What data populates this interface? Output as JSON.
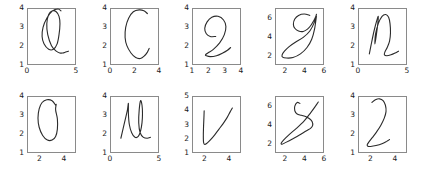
{
  "figure": {
    "title": "",
    "layout": {
      "rows": 2,
      "cols": 5
    },
    "stroke_color": "#2b2b2b",
    "axes_color": "#8a8a8a",
    "background": "#ffffff"
  },
  "chart_data": {
    "type": "line",
    "title": "",
    "xlabel": "",
    "ylabel": "",
    "panels": [
      {
        "letter": "a",
        "row": 0,
        "col": 0,
        "xlim": [
          0,
          5
        ],
        "ylim": [
          1,
          4
        ],
        "xticks": [
          0,
          5
        ],
        "yticks": [
          1,
          2,
          3,
          4
        ],
        "xticklabels": [
          "0",
          "5"
        ],
        "yticklabels": [
          "1",
          "2",
          "3",
          "4"
        ],
        "series": [
          {
            "name": "pen-stroke",
            "x": [
              3.5,
              3.2,
              2.6,
              2.0,
              1.6,
              1.5,
              1.7,
              2.2,
              2.7,
              3.1,
              3.3,
              3.4,
              3.3,
              3.0,
              2.6,
              2.2,
              2.0,
              2.1,
              2.5,
              3.0,
              3.4,
              3.7,
              4.0,
              4.3
            ],
            "y": [
              3.9,
              4.0,
              3.9,
              3.5,
              3.0,
              2.5,
              2.1,
              1.8,
              1.8,
              2.1,
              2.6,
              3.2,
              3.6,
              3.85,
              3.9,
              3.7,
              3.2,
              2.6,
              2.0,
              1.7,
              1.6,
              1.6,
              1.65,
              1.7
            ]
          }
        ]
      },
      {
        "letter": "c",
        "row": 0,
        "col": 1,
        "xlim": [
          0,
          4
        ],
        "ylim": [
          1,
          4
        ],
        "xticks": [
          0,
          2,
          4
        ],
        "yticks": [
          1,
          2,
          3,
          4
        ],
        "xticklabels": [
          "0",
          "2",
          "4"
        ],
        "yticklabels": [
          "1",
          "2",
          "3",
          "4"
        ],
        "series": [
          {
            "name": "pen-stroke",
            "x": [
              3.1,
              2.8,
              2.4,
              1.9,
              1.5,
              1.25,
              1.2,
              1.35,
              1.7,
              2.1,
              2.5,
              2.85,
              3.1,
              3.25
            ],
            "y": [
              3.75,
              3.9,
              3.95,
              3.85,
              3.5,
              3.0,
              2.45,
              2.0,
              1.6,
              1.35,
              1.3,
              1.45,
              1.65,
              1.85
            ]
          }
        ]
      },
      {
        "letter": "e",
        "row": 0,
        "col": 2,
        "xlim": [
          1,
          4
        ],
        "ylim": [
          1,
          4
        ],
        "xticks": [
          1,
          2,
          3,
          4
        ],
        "yticks": [
          1,
          2,
          3,
          4
        ],
        "xticklabels": [
          "1",
          "2",
          "3",
          "4"
        ],
        "yticklabels": [
          "1",
          "2",
          "3",
          "4"
        ],
        "series": [
          {
            "name": "pen-stroke",
            "x": [
              2.45,
              2.1,
              1.85,
              1.75,
              1.9,
              2.2,
              2.6,
              2.95,
              3.1,
              3.0,
              2.7,
              2.3,
              1.95,
              1.8,
              1.85,
              2.1,
              2.5,
              2.9,
              3.2,
              3.4
            ],
            "y": [
              2.5,
              2.5,
              2.65,
              2.95,
              3.3,
              3.55,
              3.6,
              3.4,
              3.05,
              2.6,
              2.15,
              1.8,
              1.6,
              1.5,
              1.45,
              1.4,
              1.45,
              1.6,
              1.75,
              1.9
            ]
          }
        ]
      },
      {
        "letter": "g",
        "row": 0,
        "col": 3,
        "xlim": [
          1,
          6
        ],
        "ylim": [
          1,
          7
        ],
        "xticks": [
          2,
          4,
          6
        ],
        "yticks": [
          2,
          4,
          6
        ],
        "xticklabels": [
          "2",
          "4",
          "6"
        ],
        "yticklabels": [
          "2",
          "4",
          "6"
        ],
        "series": [
          {
            "name": "pen-stroke",
            "x": [
              4.6,
              4.0,
              3.4,
              3.0,
              2.85,
              3.0,
              3.4,
              3.9,
              4.35,
              4.7,
              5.0,
              5.2,
              5.3,
              5.1,
              4.6,
              3.9,
              3.1,
              2.4,
              1.9,
              1.65,
              1.7,
              2.1,
              2.8,
              3.6,
              4.3,
              4.8,
              5.1,
              5.3
            ],
            "y": [
              6.3,
              6.45,
              6.3,
              5.9,
              5.35,
              4.9,
              4.6,
              4.55,
              4.8,
              5.2,
              5.7,
              6.1,
              6.4,
              5.6,
              4.6,
              3.9,
              3.4,
              2.9,
              2.4,
              2.0,
              1.75,
              1.65,
              1.7,
              2.1,
              2.8,
              3.7,
              4.8,
              6.2
            ]
          }
        ]
      },
      {
        "letter": "n",
        "row": 0,
        "col": 4,
        "xlim": [
          0,
          5
        ],
        "ylim": [
          1,
          4
        ],
        "xticks": [
          0,
          5
        ],
        "yticks": [
          1,
          2,
          3,
          4
        ],
        "xticklabels": [
          "0",
          "5"
        ],
        "yticklabels": [
          "1",
          "2",
          "3",
          "4"
        ],
        "series": [
          {
            "name": "pen-stroke",
            "x": [
              1.1,
              1.35,
              1.6,
              1.85,
              2.05,
              2.0,
              1.85,
              1.7,
              1.75,
              2.05,
              2.45,
              2.85,
              3.15,
              3.3,
              3.35,
              3.25,
              3.0,
              2.75,
              2.7,
              2.95,
              3.4,
              3.85,
              4.2
            ],
            "y": [
              1.55,
              2.2,
              2.8,
              3.3,
              3.6,
              3.2,
              2.6,
              2.1,
              2.6,
              3.2,
              3.6,
              3.7,
              3.55,
              3.2,
              2.7,
              2.25,
              1.9,
              1.65,
              1.5,
              1.45,
              1.5,
              1.6,
              1.7
            ]
          }
        ]
      },
      {
        "letter": "o",
        "row": 1,
        "col": 0,
        "xlim": [
          1,
          5
        ],
        "ylim": [
          1,
          4
        ],
        "xticks": [
          2,
          4
        ],
        "yticks": [
          1,
          2,
          3,
          4
        ],
        "xticklabels": [
          "2",
          "4"
        ],
        "yticklabels": [
          "1",
          "2",
          "3",
          "4"
        ],
        "series": [
          {
            "name": "pen-stroke",
            "x": [
              3.35,
              3.05,
              2.6,
              2.2,
              1.95,
              1.85,
              1.95,
              2.25,
              2.65,
              3.05,
              3.35,
              3.5,
              3.5,
              3.35,
              3.4
            ],
            "y": [
              3.55,
              3.8,
              3.85,
              3.7,
              3.35,
              2.85,
              2.35,
              1.9,
              1.65,
              1.65,
              1.85,
              2.25,
              2.8,
              3.3,
              3.6
            ]
          }
        ]
      },
      {
        "letter": "u",
        "row": 1,
        "col": 1,
        "xlim": [
          0,
          5
        ],
        "ylim": [
          1,
          4
        ],
        "xticks": [
          0,
          5
        ],
        "yticks": [
          1,
          2,
          3,
          4
        ],
        "xticklabels": [
          "0",
          "5"
        ],
        "yticklabels": [
          "1",
          "2",
          "3",
          "4"
        ],
        "series": [
          {
            "name": "pen-stroke",
            "x": [
              1.05,
              1.3,
              1.55,
              1.75,
              1.85,
              1.85,
              1.95,
              2.2,
              2.55,
              2.9,
              3.15,
              3.3,
              3.35,
              3.3,
              3.15,
              3.0,
              2.95,
              3.1,
              3.45,
              3.85,
              4.2
            ],
            "y": [
              1.75,
              2.3,
              2.85,
              3.3,
              3.65,
              3.1,
              2.5,
              2.05,
              1.8,
              1.85,
              2.15,
              2.6,
              3.1,
              3.55,
              3.8,
              3.3,
              2.6,
              2.05,
              1.8,
              1.75,
              1.8
            ]
          }
        ]
      },
      {
        "letter": "v",
        "row": 1,
        "col": 2,
        "xlim": [
          1,
          5
        ],
        "ylim": [
          1,
          5
        ],
        "xticks": [
          2,
          4
        ],
        "yticks": [
          1,
          2,
          3,
          4,
          5
        ],
        "xticklabels": [
          "2",
          "4"
        ],
        "yticklabels": [
          "1",
          "2",
          "3",
          "4",
          "5"
        ],
        "series": [
          {
            "name": "pen-stroke",
            "x": [
              1.95,
              1.93,
              1.9,
              1.88,
              1.9,
              2.0,
              2.2,
              2.5,
              2.85,
              3.2,
              3.55,
              3.9,
              4.15,
              4.35
            ],
            "y": [
              4.0,
              3.5,
              2.9,
              2.2,
              1.7,
              1.55,
              1.65,
              1.9,
              2.25,
              2.65,
              3.05,
              3.5,
              3.9,
              4.2
            ]
          }
        ]
      },
      {
        "letter": "y",
        "row": 1,
        "col": 3,
        "xlim": [
          1,
          6
        ],
        "ylim": [
          1,
          7
        ],
        "xticks": [
          2,
          4,
          6
        ],
        "yticks": [
          2,
          4,
          6
        ],
        "xticklabels": [
          "2",
          "4",
          "6"
        ],
        "yticklabels": [
          "2",
          "4",
          "6"
        ],
        "series": [
          {
            "name": "pen-stroke",
            "x": [
              3.55,
              3.25,
              3.0,
              3.0,
              3.25,
              3.7,
              4.2,
              4.6,
              4.85,
              4.9,
              4.7,
              4.2,
              3.5,
              2.7,
              2.05,
              1.65,
              1.55,
              1.8,
              2.4,
              3.2,
              4.0,
              4.7,
              5.2,
              5.5
            ],
            "y": [
              6.3,
              6.4,
              6.0,
              5.5,
              5.15,
              5.0,
              4.85,
              4.6,
              4.3,
              3.9,
              3.6,
              3.3,
              2.85,
              2.4,
              2.05,
              1.85,
              1.95,
              2.3,
              2.9,
              3.6,
              4.4,
              5.3,
              6.0,
              6.45
            ]
          }
        ]
      },
      {
        "letter": "z",
        "row": 1,
        "col": 4,
        "xlim": [
          1,
          5
        ],
        "ylim": [
          1,
          4
        ],
        "xticks": [
          2,
          4
        ],
        "yticks": [
          1,
          2,
          3,
          4
        ],
        "xticklabels": [
          "2",
          "4"
        ],
        "yticklabels": [
          "1",
          "2",
          "3",
          "4"
        ],
        "series": [
          {
            "name": "pen-stroke",
            "x": [
              2.1,
              2.4,
              2.75,
              3.05,
              3.25,
              3.3,
              3.15,
              2.85,
              2.5,
              2.15,
              1.85,
              1.7,
              1.75,
              2.0,
              2.45,
              2.95,
              3.35,
              3.6
            ],
            "y": [
              3.7,
              3.85,
              3.9,
              3.8,
              3.55,
              3.2,
              2.85,
              2.45,
              2.1,
              1.8,
              1.55,
              1.4,
              1.32,
              1.3,
              1.35,
              1.45,
              1.58,
              1.68
            ]
          }
        ]
      }
    ]
  }
}
